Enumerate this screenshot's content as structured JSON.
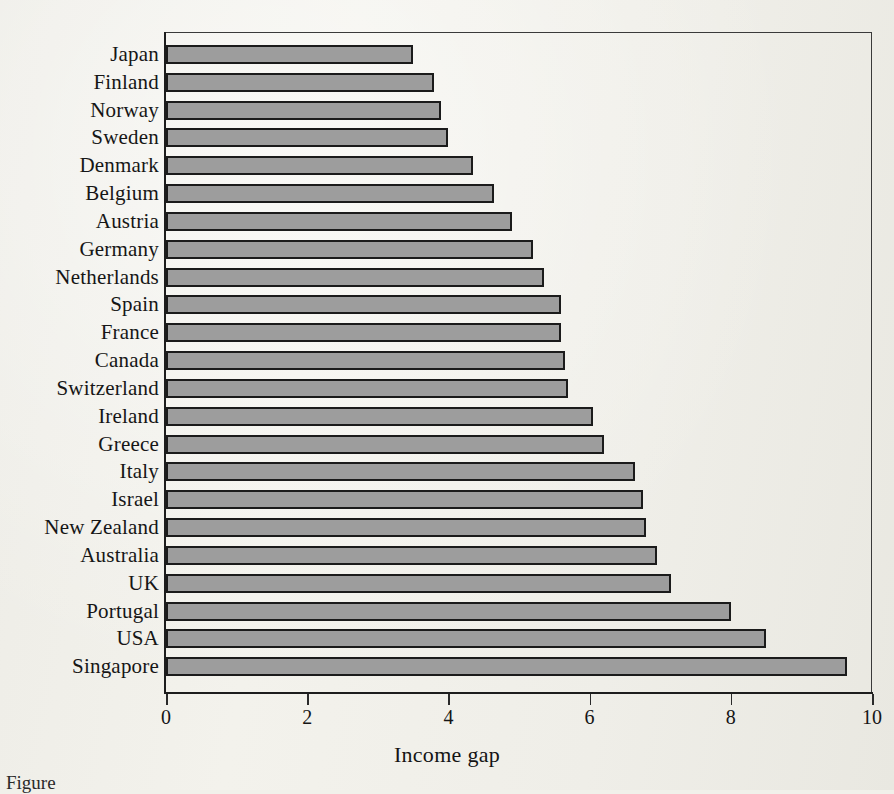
{
  "figure": {
    "caption": "Figure",
    "background_color": "#f1f0ea",
    "bar_fill_color": "#9d9d9d",
    "bar_outline_color": "#1b1b1b"
  },
  "chart_data": {
    "type": "bar",
    "orientation": "horizontal",
    "title": "",
    "xlabel": "Income gap",
    "ylabel": "",
    "xlim": [
      0,
      10
    ],
    "grid": false,
    "legend": null,
    "xticks": [
      "0",
      "2",
      "4",
      "6",
      "8",
      "10"
    ],
    "xtick_values": [
      0,
      2,
      4,
      6,
      8,
      10
    ],
    "categories": [
      "Japan",
      "Finland",
      "Norway",
      "Sweden",
      "Denmark",
      "Belgium",
      "Austria",
      "Germany",
      "Netherlands",
      "Spain",
      "France",
      "Canada",
      "Switzerland",
      "Ireland",
      "Greece",
      "Italy",
      "Israel",
      "New Zealand",
      "Australia",
      "UK",
      "Portugal",
      "USA",
      "Singapore"
    ],
    "values": [
      3.5,
      3.8,
      3.9,
      4.0,
      4.35,
      4.65,
      4.9,
      5.2,
      5.35,
      5.6,
      5.6,
      5.65,
      5.7,
      6.05,
      6.2,
      6.65,
      6.75,
      6.8,
      6.95,
      7.15,
      8.0,
      8.5,
      9.65
    ]
  }
}
